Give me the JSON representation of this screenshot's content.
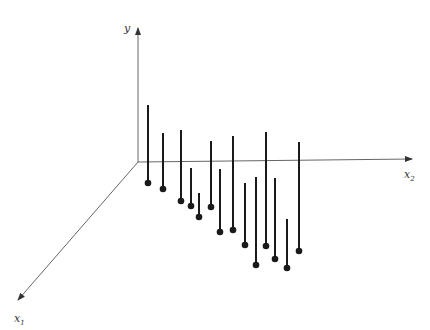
{
  "chart_data": {
    "type": "3d-stem",
    "title": "",
    "axes": {
      "y": {
        "label": "y"
      },
      "x1": {
        "label": "x",
        "subscript": "1"
      },
      "x2": {
        "label": "x",
        "subscript": "2"
      }
    },
    "origin": [
      138,
      162
    ],
    "axis_ends": {
      "y": [
        138,
        28
      ],
      "x2": [
        412,
        159
      ],
      "x1": [
        18,
        300
      ]
    },
    "stems": [
      {
        "x": 148,
        "top": 105,
        "base": 183
      },
      {
        "x": 163,
        "top": 133,
        "base": 189
      },
      {
        "x": 181,
        "top": 130,
        "base": 201
      },
      {
        "x": 191,
        "top": 168,
        "base": 206
      },
      {
        "x": 199,
        "top": 193,
        "base": 217
      },
      {
        "x": 211,
        "top": 141,
        "base": 207
      },
      {
        "x": 220,
        "top": 169,
        "base": 232
      },
      {
        "x": 233,
        "top": 136,
        "base": 230
      },
      {
        "x": 245,
        "top": 183,
        "base": 245
      },
      {
        "x": 256,
        "top": 177,
        "base": 265
      },
      {
        "x": 266,
        "top": 132,
        "base": 246
      },
      {
        "x": 275,
        "top": 178,
        "base": 259
      },
      {
        "x": 287,
        "top": 219,
        "base": 268
      },
      {
        "x": 299,
        "top": 142,
        "base": 251
      }
    ],
    "colors": {
      "axis": "#666666",
      "stem": "#1a1a1a"
    }
  }
}
